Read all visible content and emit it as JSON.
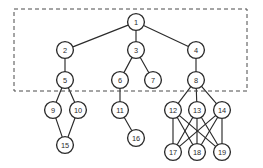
{
  "diagram": {
    "width": 263,
    "height": 168,
    "background_color": "#ffffff",
    "node_fill": "#ffffff",
    "node_stroke": "#2b2b2b",
    "edge_color": "#2b2b2b",
    "selection_stroke": "#4a4a4a",
    "node_radius": 8.4
  },
  "selection_region": {
    "label": "dashed-selection-rectangle",
    "x": 14,
    "y": 9,
    "width": 233,
    "height": 82,
    "dash_pattern": "4 3",
    "encloses_levels": [
      1,
      2,
      3
    ]
  },
  "nodes": [
    {
      "id": "1",
      "label": "1",
      "x": 136,
      "y": 22,
      "level": 1
    },
    {
      "id": "2",
      "label": "2",
      "x": 65,
      "y": 50,
      "level": 2
    },
    {
      "id": "3",
      "label": "3",
      "x": 136,
      "y": 50,
      "level": 2
    },
    {
      "id": "4",
      "label": "4",
      "x": 196,
      "y": 50,
      "level": 2
    },
    {
      "id": "5",
      "label": "5",
      "x": 65,
      "y": 80,
      "level": 3
    },
    {
      "id": "6",
      "label": "6",
      "x": 120,
      "y": 80,
      "level": 3
    },
    {
      "id": "7",
      "label": "7",
      "x": 153,
      "y": 80,
      "level": 3
    },
    {
      "id": "8",
      "label": "8",
      "x": 196,
      "y": 80,
      "level": 3
    },
    {
      "id": "9",
      "label": "9",
      "x": 53,
      "y": 110,
      "level": 4
    },
    {
      "id": "10",
      "label": "10",
      "x": 78,
      "y": 110,
      "level": 4
    },
    {
      "id": "11",
      "label": "11",
      "x": 120,
      "y": 110,
      "level": 4
    },
    {
      "id": "12",
      "label": "12",
      "x": 173,
      "y": 110,
      "level": 4
    },
    {
      "id": "13",
      "label": "13",
      "x": 197,
      "y": 110,
      "level": 4
    },
    {
      "id": "14",
      "label": "14",
      "x": 222,
      "y": 110,
      "level": 4
    },
    {
      "id": "15",
      "label": "15",
      "x": 65,
      "y": 145,
      "level": 5
    },
    {
      "id": "16",
      "label": "16",
      "x": 136,
      "y": 138,
      "level": 5
    },
    {
      "id": "17",
      "label": "17",
      "x": 173,
      "y": 152,
      "level": 5
    },
    {
      "id": "18",
      "label": "18",
      "x": 197,
      "y": 152,
      "level": 5
    },
    {
      "id": "19",
      "label": "19",
      "x": 222,
      "y": 152,
      "level": 5
    }
  ],
  "edges": [
    {
      "from": "1",
      "to": "2"
    },
    {
      "from": "1",
      "to": "3"
    },
    {
      "from": "1",
      "to": "4"
    },
    {
      "from": "2",
      "to": "5"
    },
    {
      "from": "3",
      "to": "6"
    },
    {
      "from": "3",
      "to": "7"
    },
    {
      "from": "4",
      "to": "8"
    },
    {
      "from": "5",
      "to": "9"
    },
    {
      "from": "5",
      "to": "10"
    },
    {
      "from": "6",
      "to": "11"
    },
    {
      "from": "8",
      "to": "12"
    },
    {
      "from": "8",
      "to": "13"
    },
    {
      "from": "8",
      "to": "14"
    },
    {
      "from": "9",
      "to": "15"
    },
    {
      "from": "10",
      "to": "15"
    },
    {
      "from": "11",
      "to": "16"
    },
    {
      "from": "12",
      "to": "17"
    },
    {
      "from": "12",
      "to": "18"
    },
    {
      "from": "12",
      "to": "19"
    },
    {
      "from": "13",
      "to": "17"
    },
    {
      "from": "13",
      "to": "18"
    },
    {
      "from": "13",
      "to": "19"
    },
    {
      "from": "14",
      "to": "17"
    },
    {
      "from": "14",
      "to": "18"
    },
    {
      "from": "14",
      "to": "19"
    }
  ]
}
